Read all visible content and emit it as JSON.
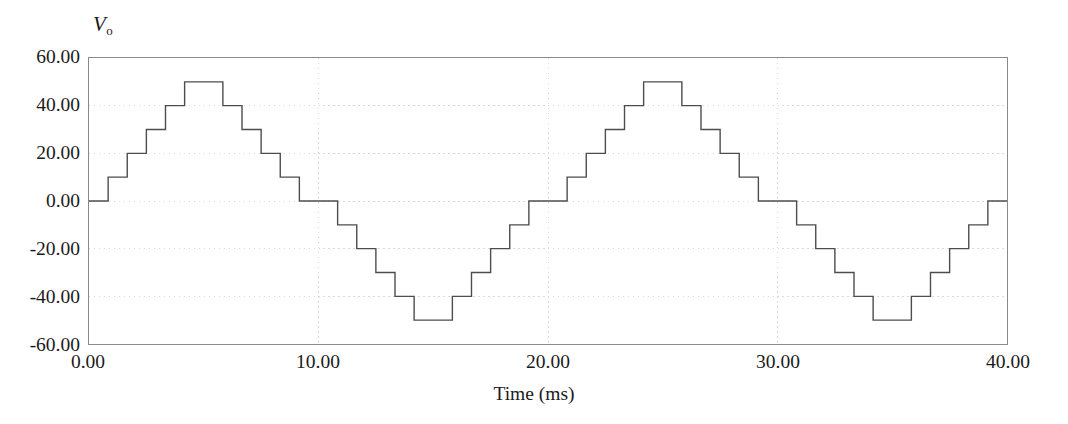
{
  "chart_data": {
    "type": "line",
    "title": "",
    "subtitle": "",
    "xlabel": "Time (ms)",
    "ylabel": "Vo",
    "ylabel_base": "V",
    "ylabel_sub": "o",
    "xlim": [
      0.0,
      40.0
    ],
    "ylim": [
      -60.0,
      60.0
    ],
    "xticks": [
      0.0,
      10.0,
      20.0,
      30.0,
      40.0
    ],
    "xticklabels": [
      "0.00",
      "10.00",
      "20.00",
      "30.00",
      "40.00"
    ],
    "yticks": [
      60.0,
      40.0,
      20.0,
      0.0,
      -20.0,
      -40.0,
      -60.0
    ],
    "yticklabels": [
      "60.00",
      "40.00",
      "20.00",
      "0.00",
      "-20.00",
      "-40.00",
      "-60.00"
    ],
    "grid": true,
    "grid_style": "dotted",
    "grid_color": "#d9d9d9",
    "legend": null,
    "line_color": "#4d4d4d",
    "line_width": 1.4,
    "drawstyle": "steps-post",
    "step_amplitude": 10,
    "levels": [
      -50,
      -40,
      -30,
      -20,
      -10,
      0,
      10,
      20,
      30,
      40,
      50
    ],
    "period_ms": 20.0,
    "step_duration_ms": 0.8333,
    "series": [
      {
        "name": "Vo",
        "x": [
          0.0,
          0.8333,
          1.6667,
          2.5,
          3.3333,
          4.1667,
          5.8333,
          6.6667,
          7.5,
          8.3333,
          9.1667,
          10.0,
          10.8333,
          11.6667,
          12.5,
          13.3333,
          14.1667,
          15.8333,
          16.6667,
          17.5,
          18.3333,
          19.1667,
          20.0,
          20.8333,
          21.6667,
          22.5,
          23.3333,
          24.1667,
          25.8333,
          26.6667,
          27.5,
          28.3333,
          29.1667,
          30.0,
          30.8333,
          31.6667,
          32.5,
          33.3333,
          34.1667,
          35.8333,
          36.6667,
          37.5,
          38.3333,
          39.1667,
          40.0
        ],
        "y": [
          0,
          10,
          20,
          30,
          40,
          50,
          40,
          30,
          20,
          10,
          0,
          0,
          -10,
          -20,
          -30,
          -40,
          -50,
          -40,
          -30,
          -20,
          -10,
          0,
          0,
          10,
          20,
          30,
          40,
          50,
          40,
          30,
          20,
          10,
          0,
          0,
          -10,
          -20,
          -30,
          -40,
          -50,
          -40,
          -30,
          -20,
          -10,
          0,
          0
        ]
      }
    ]
  }
}
